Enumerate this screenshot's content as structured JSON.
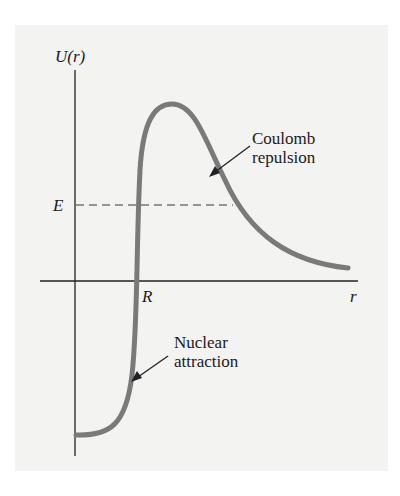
{
  "diagram": {
    "y_axis_label": "U(r)",
    "x_axis_label": "r",
    "energy_label": "E",
    "radius_label": "R",
    "annotations": {
      "coulomb_line1": "Coulomb",
      "coulomb_line2": "repulsion",
      "nuclear_line1": "Nuclear",
      "nuclear_line2": "attraction"
    },
    "colors": {
      "background": "#f3f3f1",
      "curve": "#7a7a7a",
      "axes": "#222222"
    }
  }
}
